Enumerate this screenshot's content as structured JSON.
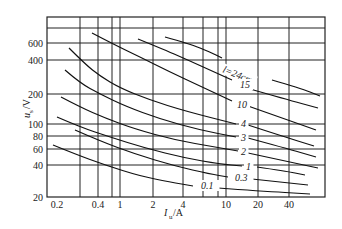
{
  "chart_data": {
    "type": "line",
    "title": "",
    "xlabel": "I_u/A",
    "ylabel": "u_s/V",
    "xscale": "log",
    "yscale": "log",
    "xlim": [
      0.2,
      80
    ],
    "ylim": [
      20,
      900
    ],
    "grid": true,
    "legend_position": "inline labels on curves",
    "x_ticks": [
      "0.2",
      "0.4",
      "1",
      "2",
      "4",
      "10",
      "20",
      "40"
    ],
    "y_ticks": [
      "20",
      "40",
      "60",
      "80",
      "100",
      "200",
      "400",
      "600"
    ],
    "parameter": "l (gap length, cm)",
    "series": [
      {
        "name": "l=24cm",
        "label": "l=24cm",
        "points": [
          [
            1.7,
            620
          ],
          [
            3.5,
            470
          ],
          [
            7.5,
            360
          ],
          [
            20,
            260
          ],
          [
            60,
            200
          ]
        ]
      },
      {
        "name": "15",
        "label": "15",
        "points": [
          [
            1.0,
            590
          ],
          [
            2.5,
            410
          ],
          [
            8,
            290
          ],
          [
            20,
            210
          ],
          [
            60,
            160
          ]
        ]
      },
      {
        "name": "10",
        "label": "10",
        "points": [
          [
            0.35,
            700
          ],
          [
            1.2,
            420
          ],
          [
            3,
            270
          ],
          [
            8,
            190
          ],
          [
            20,
            150
          ],
          [
            60,
            110
          ]
        ]
      },
      {
        "name": "4",
        "label": "4",
        "points": [
          [
            0.22,
            500
          ],
          [
            0.5,
            340
          ],
          [
            2,
            190
          ],
          [
            8,
            110
          ],
          [
            20,
            90
          ],
          [
            60,
            75
          ]
        ]
      },
      {
        "name": "3",
        "label": "3",
        "points": [
          [
            0.21,
            300
          ],
          [
            0.5,
            210
          ],
          [
            2,
            130
          ],
          [
            8,
            88
          ],
          [
            20,
            78
          ],
          [
            60,
            65
          ]
        ]
      },
      {
        "name": "2",
        "label": "2",
        "points": [
          [
            0.2,
            180
          ],
          [
            0.5,
            130
          ],
          [
            2,
            90
          ],
          [
            8,
            70
          ],
          [
            20,
            62
          ],
          [
            60,
            52
          ]
        ]
      },
      {
        "name": "1",
        "label": "1",
        "points": [
          [
            0.2,
            110
          ],
          [
            0.5,
            85
          ],
          [
            2,
            62
          ],
          [
            10,
            45
          ],
          [
            20,
            42
          ],
          [
            50,
            36
          ]
        ]
      },
      {
        "name": "0.3",
        "label": "0.3",
        "points": [
          [
            0.22,
            65
          ],
          [
            0.6,
            52
          ],
          [
            2,
            42
          ],
          [
            8,
            34
          ],
          [
            20,
            31
          ],
          [
            55,
            28
          ]
        ]
      },
      {
        "name": "0.1",
        "label": "0.1",
        "points": [
          [
            0.2,
            62
          ],
          [
            0.5,
            48
          ],
          [
            2,
            33
          ],
          [
            5,
            27
          ],
          [
            10,
            25
          ],
          [
            55,
            22
          ]
        ]
      }
    ]
  },
  "plot": {
    "left": 47,
    "right": 325,
    "top": 17,
    "bottom": 197,
    "x_grid_px": [
      80,
      98,
      112,
      120,
      153,
      183,
      203,
      218,
      226,
      258,
      289
    ],
    "y_grid_px": [
      28,
      43,
      60,
      94,
      124,
      136,
      149,
      165
    ],
    "x_tick_labels": [
      {
        "text": "0.2",
        "x": 57
      },
      {
        "text": "0.4",
        "x": 98
      },
      {
        "text": "1",
        "x": 120
      },
      {
        "text": "2",
        "x": 153
      },
      {
        "text": "4",
        "x": 183
      },
      {
        "text": "10",
        "x": 226
      },
      {
        "text": "20",
        "x": 258
      },
      {
        "text": "40",
        "x": 289
      }
    ],
    "y_tick_labels": [
      {
        "text": "600",
        "y": 43
      },
      {
        "text": "400",
        "y": 60
      },
      {
        "text": "200",
        "y": 94
      },
      {
        "text": "100",
        "y": 124
      },
      {
        "text": "80",
        "y": 136
      },
      {
        "text": "60",
        "y": 149
      },
      {
        "text": "40",
        "y": 165
      },
      {
        "text": "20",
        "y": 197
      }
    ],
    "curves_px": [
      {
        "label": "l=24cm",
        "lx": 222,
        "ly": 72,
        "rot": 22,
        "left": [
          [
            165,
            37
          ],
          [
            190,
            44
          ],
          [
            210,
            52
          ],
          [
            222,
            58
          ]
        ],
        "right": [
          [
            272,
            80
          ],
          [
            300,
            88
          ],
          [
            320,
            96
          ]
        ]
      },
      {
        "label": "15",
        "lx": 240,
        "ly": 88,
        "rot": 0,
        "left": [
          [
            138,
            39
          ],
          [
            165,
            50
          ],
          [
            190,
            61
          ],
          [
            212,
            71
          ],
          [
            232,
            80
          ]
        ],
        "right": [
          [
            250,
            89
          ],
          [
            285,
            99
          ],
          [
            318,
            108
          ]
        ]
      },
      {
        "label": "10",
        "lx": 237,
        "ly": 108,
        "rot": 0,
        "left": [
          [
            92,
            33
          ],
          [
            115,
            45
          ],
          [
            140,
            57
          ],
          [
            170,
            72
          ],
          [
            200,
            86
          ],
          [
            232,
            101
          ]
        ],
        "right": [
          [
            248,
            106
          ],
          [
            285,
            119
          ],
          [
            316,
            130
          ]
        ]
      },
      {
        "label": "4",
        "lx": 241,
        "ly": 127,
        "rot": 0,
        "left": [
          [
            69,
            48
          ],
          [
            85,
            64
          ],
          [
            100,
            76
          ],
          [
            120,
            88
          ],
          [
            150,
            100
          ],
          [
            185,
            111
          ],
          [
            236,
            124
          ]
        ],
        "right": [
          [
            248,
            125
          ],
          [
            285,
            137
          ],
          [
            314,
            146
          ]
        ]
      },
      {
        "label": "3",
        "lx": 241,
        "ly": 141,
        "rot": 0,
        "left": [
          [
            65,
            70
          ],
          [
            80,
            83
          ],
          [
            100,
            94
          ],
          [
            125,
            106
          ],
          [
            160,
            119
          ],
          [
            200,
            130
          ],
          [
            236,
            137
          ]
        ],
        "right": [
          [
            248,
            138
          ],
          [
            285,
            148
          ],
          [
            316,
            157
          ]
        ]
      },
      {
        "label": "2",
        "lx": 241,
        "ly": 155,
        "rot": 0,
        "left": [
          [
            61,
            97
          ],
          [
            80,
            107
          ],
          [
            105,
            118
          ],
          [
            135,
            129
          ],
          [
            175,
            140
          ],
          [
            215,
            147
          ],
          [
            238,
            151
          ]
        ],
        "right": [
          [
            248,
            153
          ],
          [
            285,
            161
          ],
          [
            318,
            168
          ]
        ]
      },
      {
        "label": "1",
        "lx": 246,
        "ly": 170,
        "rot": 0,
        "left": [
          [
            57,
            117
          ],
          [
            80,
            127
          ],
          [
            110,
            137
          ],
          [
            145,
            148
          ],
          [
            185,
            158
          ],
          [
            220,
            164
          ],
          [
            242,
            166
          ]
        ],
        "right": [
          [
            257,
            167
          ],
          [
            285,
            171
          ],
          [
            305,
            175
          ]
        ]
      },
      {
        "label": "0.3",
        "lx": 235,
        "ly": 181,
        "rot": 0,
        "left": [
          [
            75,
            130
          ],
          [
            100,
            141
          ],
          [
            135,
            154
          ],
          [
            175,
            166
          ],
          [
            210,
            174
          ],
          [
            228,
            177
          ]
        ],
        "right": [
          [
            252,
            179
          ],
          [
            280,
            182
          ],
          [
            308,
            185
          ]
        ]
      },
      {
        "label": "0.1",
        "lx": 201,
        "ly": 189,
        "rot": 0,
        "left": [
          [
            53,
            145
          ],
          [
            75,
            154
          ],
          [
            105,
            165
          ],
          [
            140,
            176
          ],
          [
            170,
            182
          ],
          [
            193,
            186
          ]
        ],
        "right": [
          [
            218,
            188
          ],
          [
            260,
            191
          ],
          [
            310,
            194
          ]
        ]
      }
    ],
    "xlabel_main": "I",
    "xlabel_sub": "u",
    "xlabel_unit": "/A",
    "ylabel_main": "u",
    "ylabel_sub": "s",
    "ylabel_unit": "/V"
  }
}
